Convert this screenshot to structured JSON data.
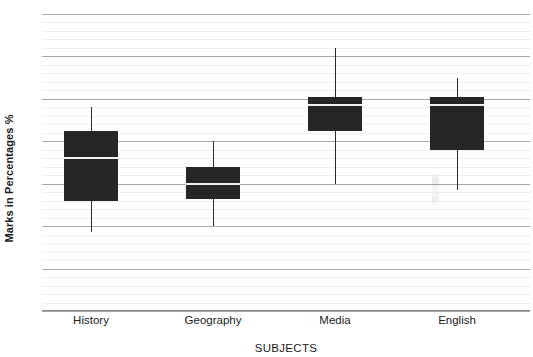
{
  "chart_data": {
    "type": "box",
    "title": "",
    "xlabel": "SUBJECTS",
    "ylabel": "Marks in Percentages %",
    "ylim": [
      30,
      100
    ],
    "ytick_labels": [
      "30",
      "40",
      "50",
      "60",
      "70",
      "80",
      "90",
      "100"
    ],
    "ytick_values": [
      30,
      40,
      50,
      60,
      70,
      80,
      90,
      100
    ],
    "grid": true,
    "grid_minor_step": 2,
    "grid_major_step": 10,
    "legend": "none",
    "categories": [
      "History",
      "Geography",
      "Media",
      "English"
    ],
    "boxes": [
      {
        "category": "History",
        "min": 48.5,
        "q1": 56,
        "median": 66,
        "q3": 72.5,
        "max": 78
      },
      {
        "category": "Geography",
        "min": 50,
        "q1": 56.5,
        "median": 60,
        "q3": 64,
        "max": 70
      },
      {
        "category": "Media",
        "min": 60,
        "q1": 72.5,
        "median": 78.5,
        "q3": 80.5,
        "max": 92
      },
      {
        "category": "English",
        "min": 58.5,
        "q1": 68,
        "median": 78.5,
        "q3": 80.5,
        "max": 85
      }
    ],
    "colors": {
      "box_fill": "#262626",
      "median": "#f2f2f2",
      "whisker": "#2b2b2b",
      "grid_major": "#a8a8a8",
      "grid_minor": "#f0f0f0",
      "background": "#ffffff",
      "text": "#1a1a1a"
    }
  }
}
